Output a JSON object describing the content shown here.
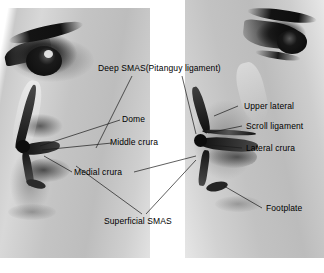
{
  "figure": {
    "view_left": "left profile",
    "view_right": "right profile",
    "caption": "",
    "background_color": "#ffffff",
    "label_color": "#000000",
    "leader_color": "#1a1a1a"
  },
  "labels": {
    "deep_smas": "Deep SMAS(Pitanguy ligament)",
    "dome": "Dome",
    "middle_crura": "Middle crura",
    "medial_crura": "Medial crura",
    "superficial_smas": "Superficial SMAS",
    "upper_lateral": "Upper lateral",
    "scroll_ligament": "Scroll ligament",
    "lateral_crura": "Lateral crura",
    "footplate": "Footplate"
  },
  "anatomy_structures": [
    {
      "name": "Deep SMAS(Pitanguy ligament)",
      "side": "both"
    },
    {
      "name": "Dome",
      "side": "left"
    },
    {
      "name": "Middle crura",
      "side": "left"
    },
    {
      "name": "Medial crura",
      "side": "left"
    },
    {
      "name": "Superficial SMAS",
      "side": "both"
    },
    {
      "name": "Upper lateral",
      "side": "right"
    },
    {
      "name": "Scroll ligament",
      "side": "right"
    },
    {
      "name": "Lateral crura",
      "side": "right"
    },
    {
      "name": "Footplate",
      "side": "right"
    }
  ]
}
